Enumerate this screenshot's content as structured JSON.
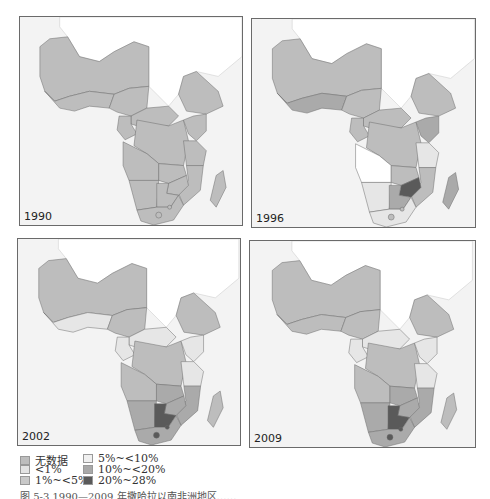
{
  "figure": {
    "panels": [
      {
        "year": "1990",
        "position": "top-left"
      },
      {
        "year": "1996",
        "position": "top-right"
      },
      {
        "year": "2002",
        "position": "bottom-left"
      },
      {
        "year": "2009",
        "position": "bottom-right"
      }
    ],
    "legend": {
      "items": [
        {
          "label": "无数据",
          "color": "#bdbdbd"
        },
        {
          "label": "<1%",
          "color": "#e3e3e3"
        },
        {
          "label": "1%~<5%",
          "color": "#c9c9c9"
        },
        {
          "label": "5%~<10%",
          "color": "#f0f0f0"
        },
        {
          "label": "10%~<20%",
          "color": "#a9a9a9"
        },
        {
          "label": "20%~28%",
          "color": "#5a5a5a"
        }
      ]
    },
    "caption": "图 5-3   1990—2009 年撒哈拉以南非洲地区……"
  },
  "colors": {
    "ocean": "#f3f3f3",
    "north_africa": "#ffffff",
    "border": "#6a6a6a",
    "class_default": "#bdbdbd",
    "class_light": "#e6e6e6",
    "class_mid": "#aaaaaa",
    "class_dark": "#5a5a5a"
  }
}
